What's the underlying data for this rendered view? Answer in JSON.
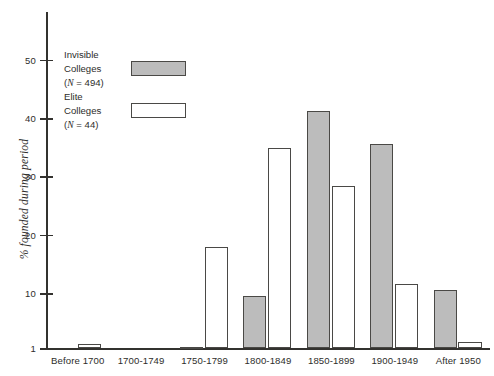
{
  "chart_data": {
    "type": "bar",
    "title": "",
    "xlabel": "",
    "ylabel": "% founded during period",
    "categories": [
      "Before 1700",
      "1700-1749",
      "1750-1799",
      "1800-1849",
      "1850-1899",
      "1900-1949",
      "After 1950"
    ],
    "series": [
      {
        "name": "Invisible Colleges (N = 494)",
        "values": [
          0,
          0,
          0.8,
          9.5,
          41.0,
          35.4,
          10.5
        ],
        "color": "#bcbcbc"
      },
      {
        "name": "Elite Colleges (N = 44)",
        "values": [
          1.3,
          0,
          17.8,
          34.7,
          28.2,
          11.5,
          1.8
        ],
        "color": "#ffffff"
      }
    ],
    "ylim": [
      1,
      55
    ],
    "yticks": [
      1,
      10,
      20,
      30,
      40,
      50
    ],
    "ytick_labels": [
      "1",
      "10",
      "20",
      "30",
      "40",
      "50"
    ],
    "grid": false,
    "legend_position": "upper-left"
  },
  "axis": {
    "y_title": "% founded during period",
    "tick_labels": {
      "t0": "1",
      "t1": "10",
      "t2": "20",
      "t3": "30",
      "t4": "40",
      "t5": "50"
    }
  },
  "categories": {
    "c0": "Before 1700",
    "c1": "1700-1749",
    "c2": "1750-1799",
    "c3": "1800-1849",
    "c4": "1850-1899",
    "c5": "1900-1949",
    "c6": "After 1950"
  },
  "legend": {
    "entries": [
      {
        "line1": "Invisible",
        "line2": "Colleges",
        "line3_pre": "(",
        "line3_ital": "N",
        "line3_post": " = 494)",
        "swatch": "filled-gray"
      },
      {
        "line1": "Elite",
        "line2": "Colleges",
        "line3_pre": "(",
        "line3_ital": "N",
        "line3_post": " = 44)",
        "swatch": "open-white"
      }
    ],
    "e0": {
      "l1": "Invisible",
      "l2": "Colleges",
      "l3a": "(",
      "l3b": "N",
      "l3c": " = 494)"
    },
    "e1": {
      "l1": "Elite",
      "l2": "Colleges",
      "l3a": "(",
      "l3b": "N",
      "l3c": " = 44)"
    }
  },
  "colors": {
    "invisible_fill": "#bcbcbc",
    "elite_fill": "#ffffff",
    "bar_border": "#4a4946",
    "axis": "#33322f",
    "text": "#2e2d2b"
  }
}
